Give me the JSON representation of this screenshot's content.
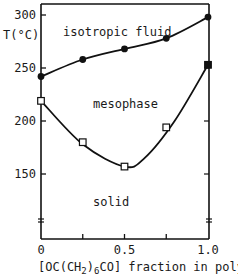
{
  "chart_data": {
    "type": "line",
    "title": "",
    "xlabel": "[OC(CH2)6CO] fraction in polymer",
    "xlabel_parts": {
      "pre": "[OC(CH",
      "sub1": "2",
      "mid": ")",
      "sub2": "6",
      "post": "CO] fraction in polymer"
    },
    "ylabel": "T(°C)",
    "xlim": [
      0,
      1.0
    ],
    "ylim": [
      100,
      305
    ],
    "x_ticks": [
      0,
      0.25,
      0.5,
      0.75,
      1.0
    ],
    "x_tick_labels": [
      "0",
      "",
      "0.5",
      "",
      "1.0"
    ],
    "y_ticks": [
      150,
      200,
      250,
      300
    ],
    "y_tick_labels": [
      "150",
      "200",
      "250",
      "300"
    ],
    "axis_break": true,
    "grid": false,
    "legend": null,
    "region_labels": [
      "isotropic fluid",
      "mesophase",
      "solid"
    ],
    "series": [
      {
        "name": "isotropization (mesophase → isotropic fluid)",
        "marker": "filled-circle",
        "x": [
          0,
          0.25,
          0.5,
          0.75,
          1.0
        ],
        "values": [
          242,
          258,
          268,
          278,
          298
        ]
      },
      {
        "name": "melting (solid → mesophase)",
        "marker": "open-square",
        "x": [
          0,
          0.25,
          0.5,
          0.75,
          1.0
        ],
        "values": [
          219,
          180,
          157,
          194,
          253
        ],
        "marker_overrides": {
          "4": "filled-square"
        }
      }
    ]
  }
}
